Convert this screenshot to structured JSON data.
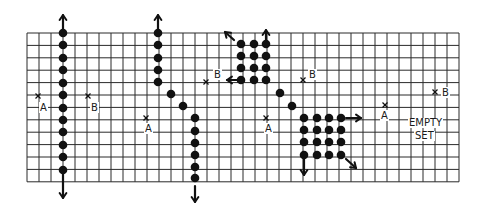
{
  "grid": {
    "left": 27,
    "top": 33,
    "cols": 36,
    "rows": 12,
    "col_w": 12,
    "row_h": 12.4,
    "line_color": "#2a2a2a"
  },
  "colors": {
    "ink": "#111111",
    "paper": "#ffffff"
  },
  "panels": [
    {
      "id": "panel-1",
      "dots": [
        [
          63,
          33
        ],
        [
          63,
          45
        ],
        [
          63,
          58
        ],
        [
          63,
          70
        ],
        [
          63,
          83
        ],
        [
          63,
          95
        ],
        [
          63,
          108
        ],
        [
          63,
          120
        ],
        [
          63,
          132
        ],
        [
          63,
          145
        ],
        [
          63,
          157
        ],
        [
          63,
          170
        ]
      ],
      "arrows": [
        {
          "name": "arrow-up-icon",
          "from": [
            63,
            30
          ],
          "to": [
            63,
            15
          ]
        },
        {
          "name": "arrow-down-icon",
          "from": [
            63,
            172
          ],
          "to": [
            63,
            198
          ]
        }
      ],
      "markers": [
        {
          "label": "A",
          "x": [
            38,
            96
          ],
          "text": [
            40,
            111
          ]
        },
        {
          "label": "B",
          "x": [
            88,
            96
          ],
          "text": [
            91,
            111
          ]
        }
      ]
    },
    {
      "id": "panel-2",
      "dots": [
        [
          158,
          33
        ],
        [
          158,
          45
        ],
        [
          158,
          58
        ],
        [
          158,
          70
        ],
        [
          158,
          82
        ],
        [
          171,
          94
        ],
        [
          183,
          106
        ],
        [
          195,
          118
        ],
        [
          195,
          131
        ],
        [
          195,
          143
        ],
        [
          195,
          155
        ],
        [
          195,
          167
        ],
        [
          195,
          178
        ]
      ],
      "arrows": [
        {
          "name": "arrow-up-icon",
          "from": [
            158,
            30
          ],
          "to": [
            158,
            15
          ]
        },
        {
          "name": "arrow-down-icon",
          "from": [
            195,
            186
          ],
          "to": [
            195,
            202
          ]
        }
      ],
      "markers": [
        {
          "label": "A",
          "x": [
            146,
            118
          ],
          "text": [
            145,
            132
          ]
        },
        {
          "label": "B",
          "x": [
            206,
            82
          ],
          "text": [
            214,
            78
          ]
        }
      ]
    },
    {
      "id": "panel-3",
      "dots": [
        [
          241,
          44
        ],
        [
          254,
          44
        ],
        [
          266,
          44
        ],
        [
          241,
          56
        ],
        [
          254,
          56
        ],
        [
          266,
          56
        ],
        [
          241,
          68
        ],
        [
          254,
          68
        ],
        [
          266,
          68
        ],
        [
          241,
          80
        ],
        [
          254,
          80
        ],
        [
          266,
          80
        ],
        [
          280,
          93
        ],
        [
          292,
          106
        ]
      ],
      "arrows": [
        {
          "name": "arrow-nw-icon",
          "from": [
            234,
            40
          ],
          "to": [
            225,
            32
          ]
        },
        {
          "name": "arrow-up-icon",
          "from": [
            266,
            42
          ],
          "to": [
            266,
            30
          ]
        },
        {
          "name": "arrow-left-icon",
          "from": [
            238,
            80
          ],
          "to": [
            227,
            80
          ]
        }
      ],
      "markers": [
        {
          "label": "A",
          "x": [
            266,
            118
          ],
          "text": [
            265,
            132
          ]
        },
        {
          "label": "B",
          "x": [
            303,
            80
          ],
          "text": [
            309,
            78
          ]
        }
      ]
    },
    {
      "id": "panel-4",
      "dots": [
        [
          304,
          118
        ],
        [
          317,
          118
        ],
        [
          329,
          118
        ],
        [
          341,
          118
        ],
        [
          304,
          130
        ],
        [
          317,
          130
        ],
        [
          329,
          130
        ],
        [
          341,
          130
        ],
        [
          304,
          142
        ],
        [
          317,
          142
        ],
        [
          329,
          142
        ],
        [
          341,
          142
        ],
        [
          304,
          155
        ],
        [
          317,
          155
        ],
        [
          329,
          155
        ],
        [
          341,
          155
        ]
      ],
      "arrows": [
        {
          "name": "arrow-right-icon",
          "from": [
            346,
            118
          ],
          "to": [
            361,
            118
          ]
        },
        {
          "name": "arrow-down-icon",
          "from": [
            304,
            158
          ],
          "to": [
            304,
            175
          ]
        },
        {
          "name": "arrow-se-icon",
          "from": [
            346,
            159
          ],
          "to": [
            356,
            168
          ]
        }
      ],
      "markers": [
        {
          "label": "A",
          "x": [
            385,
            105
          ],
          "text": [
            381,
            119
          ]
        },
        {
          "label": "B",
          "x": [
            435,
            92
          ],
          "text": [
            442,
            96
          ]
        }
      ],
      "caption": {
        "line1": "EMPTY",
        "line2": "SET",
        "pos1": [
          408,
          123
        ],
        "pos2": [
          413,
          135
        ]
      }
    }
  ]
}
